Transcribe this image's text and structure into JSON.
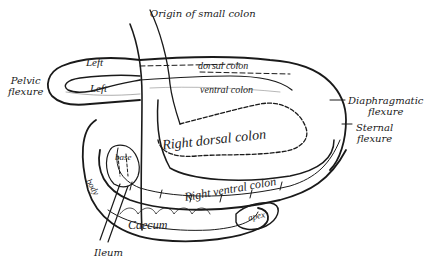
{
  "figure": {
    "colors": {
      "ink": "#1a1a1a",
      "background": "#ffffff"
    }
  },
  "external_labels": {
    "origin_small_colon": "Origin of small colon",
    "pelvic_flexure_1": "Pelvic",
    "pelvic_flexure_2": "flexure",
    "diaphragmatic_flexure_1": "Diaphragmatic",
    "diaphragmatic_flexure_2": "flexure",
    "sternal_flexure_1": "Sternal",
    "sternal_flexure_2": "flexure",
    "ileum": "Ileum"
  },
  "internal_labels": {
    "left_dorsal_left": "Left",
    "left_dorsal_rest": "dorsal colon",
    "left_ventral_left": "Left",
    "left_ventral_rest": "ventral colon",
    "right_dorsal": "Right dorsal colon",
    "right_ventral": "Right ventral colon",
    "caecum": "Caecum",
    "caecum_base": "base",
    "caecum_body": "body",
    "caecum_apex": "apex"
  }
}
